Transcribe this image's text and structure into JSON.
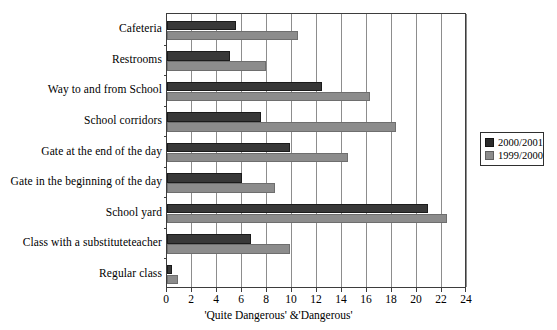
{
  "chart_data": {
    "type": "bar",
    "orientation": "horizontal",
    "title": "",
    "xlabel": "'Quite Dangerous' &'Dangerous'",
    "ylabel": "",
    "xlim": [
      0,
      24
    ],
    "xticks": [
      0,
      2,
      4,
      6,
      8,
      10,
      12,
      14,
      16,
      18,
      20,
      22,
      24
    ],
    "grid": "vertical",
    "legend_position": "right",
    "categories": [
      "Cafeteria",
      "Restrooms",
      "Way to and from School",
      "School corridors",
      "Gate at the end of the day",
      "Gate in the beginning of the day",
      "School yard",
      "Class with a substituteteacher",
      "Regular class"
    ],
    "series": [
      {
        "name": "2000/2001",
        "color": "#383838",
        "values": [
          5.5,
          5.0,
          12.4,
          7.5,
          9.8,
          6.0,
          20.9,
          6.7,
          0.4
        ]
      },
      {
        "name": "1999/2000",
        "color": "#8c8c8c",
        "values": [
          10.5,
          7.9,
          16.2,
          18.3,
          14.5,
          8.6,
          22.4,
          9.8,
          0.9
        ]
      }
    ]
  },
  "legend": {
    "items": [
      {
        "label": "2000/2001"
      },
      {
        "label": "1999/2000"
      }
    ]
  },
  "axis": {
    "x_title": "'Quite Dangerous' &'Dangerous'",
    "tick_labels": [
      "0",
      "2",
      "4",
      "6",
      "8",
      "10",
      "12",
      "14",
      "16",
      "18",
      "20",
      "22",
      "24"
    ]
  },
  "footer": {
    "text": ""
  }
}
